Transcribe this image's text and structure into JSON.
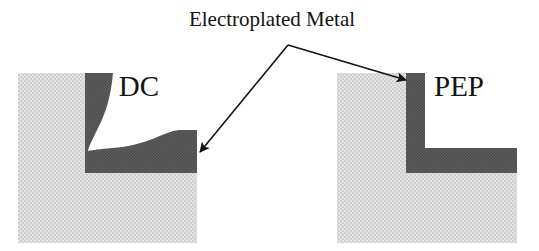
{
  "figure": {
    "title": "Electroplated Metal",
    "background_color": "#ffffff",
    "width": 539,
    "height": 251
  },
  "palette": {
    "substrate_gray": "#d8d8d8",
    "substrate_gray_dark": "#c9c9c9",
    "metal_gray": "#595959",
    "metal_gray_dark": "#4a4a4a",
    "line_color": "#131313",
    "text_color": "#131313"
  },
  "annotation": {
    "callout_label": "Electroplated Metal",
    "vertex": {
      "x": 288,
      "y": 45
    },
    "arrows": [
      {
        "name": "arrow-to-dc",
        "target_x": 198,
        "target_y": 150,
        "points_to": "DC"
      },
      {
        "name": "arrow-to-pep",
        "target_x": 404,
        "target_y": 79,
        "points_to": "PEP"
      }
    ]
  },
  "panels": [
    {
      "id": "dc",
      "label": "DC",
      "label_x": 139,
      "label_y": 96,
      "caption": "Direct current plating: non-conformal, curved and uneven metal deposit",
      "substrate": {
        "x": 18,
        "y": 73,
        "width": 179,
        "height": 170
      },
      "metal": {
        "fill": "#595959",
        "profile": "non-conformal",
        "wall_outer_x": 85,
        "wall_top_y": 73,
        "floor_bottom_y": 173,
        "right_edge_x": 197
      }
    },
    {
      "id": "pep",
      "label": "PEP",
      "label_x": 459,
      "label_y": 96,
      "caption": "Pulse electroplating: conformal, uniform thickness metal deposit",
      "substrate": {
        "x": 337,
        "y": 73,
        "width": 180,
        "height": 170
      },
      "metal": {
        "fill": "#595959",
        "profile": "conformal",
        "wall_outer_x": 406,
        "wall_inner_x": 425,
        "wall_top_y": 73,
        "floor_top_y": 148,
        "floor_bottom_y": 173,
        "right_edge_x": 517
      }
    }
  ]
}
